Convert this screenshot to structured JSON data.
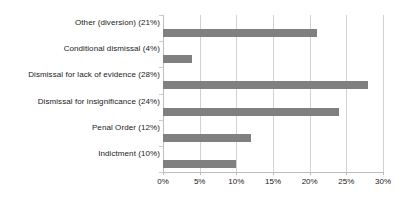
{
  "chart_data": {
    "type": "bar",
    "orientation": "horizontal",
    "title": "",
    "subtitle": "",
    "xlabel": "",
    "ylabel": "",
    "categories": [
      "Other (diversion) (21%)",
      "Conditional dismissal (4%)",
      "Dismissal for lack of evidence (28%)",
      "Dismissal for insignificance (24%)",
      "Penal Order (12%)",
      "Indictment (10%)"
    ],
    "values": [
      21,
      4,
      28,
      24,
      12,
      10
    ],
    "value_unit": "%",
    "xlim": [
      0,
      30
    ],
    "xticks": [
      0,
      5,
      10,
      15,
      20,
      25,
      30
    ],
    "xtick_labels": [
      "0%",
      "5%",
      "10%",
      "15%",
      "20%",
      "25%",
      "30%"
    ],
    "grid": "vertical",
    "legend": "none",
    "bar_color": "#808080",
    "gridline_color": "#d2d2d2",
    "axis_color": "#bdbdbd",
    "text_color": "#1a1a1a",
    "background_color": "#ffffff"
  }
}
